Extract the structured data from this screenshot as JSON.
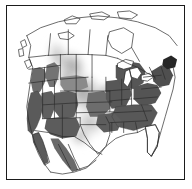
{
  "figure": {
    "type": "range-map",
    "region": "North America",
    "title": "",
    "frame": {
      "border_color": "#1b1b1b",
      "background_color": "#ffffff"
    }
  },
  "palette": {
    "background": "#ffffff",
    "outline": "#2b2b2b",
    "coastline": "#1f1f1f",
    "core_range_dark": "#5a5a5a",
    "range_mid": "#7d7d7d",
    "plume_light": "#adadad",
    "plume_faint": "#cfcfcf",
    "plume_faintest": "#e6e6e6",
    "near_black_patch": "#262626",
    "water": "#ffffff"
  },
  "map": {
    "shaded_dark_regions": [
      "California",
      "Nevada",
      "Oregon (west)",
      "Washington (west)",
      "Idaho (south)",
      "Utah",
      "Arizona",
      "New Mexico",
      "Colorado",
      "Wyoming (south)",
      "Montana (west edge)",
      "Kansas",
      "Oklahoma",
      "Missouri",
      "Arkansas",
      "Louisiana",
      "Mississippi",
      "Alabama",
      "Georgia",
      "South Carolina",
      "North Carolina",
      "Tennessee",
      "Kentucky",
      "Virginia",
      "West Virginia",
      "Ohio",
      "Indiana",
      "Illinois",
      "Iowa",
      "Wisconsin (south)",
      "Michigan",
      "Pennsylvania",
      "New York",
      "New England",
      "Maritime Canada (south)"
    ],
    "unshaded_regions": [
      "Florida",
      "Great Lakes",
      "Hudson Bay",
      "Quebec",
      "Labrador",
      "Canadian Arctic Islands",
      "Northern Canada",
      "Mexico (interior)",
      "Baja California (interior)",
      "Gulf of Mexico",
      "Atlantic Ocean",
      "Pacific Ocean"
    ],
    "plume_description": "Diffuse light gray gradient over the Great Plains extending northwest into Alberta and British Columbia and fading south toward Texas and northern Mexico"
  },
  "icons": {
    "map_icon": "map-icon"
  }
}
